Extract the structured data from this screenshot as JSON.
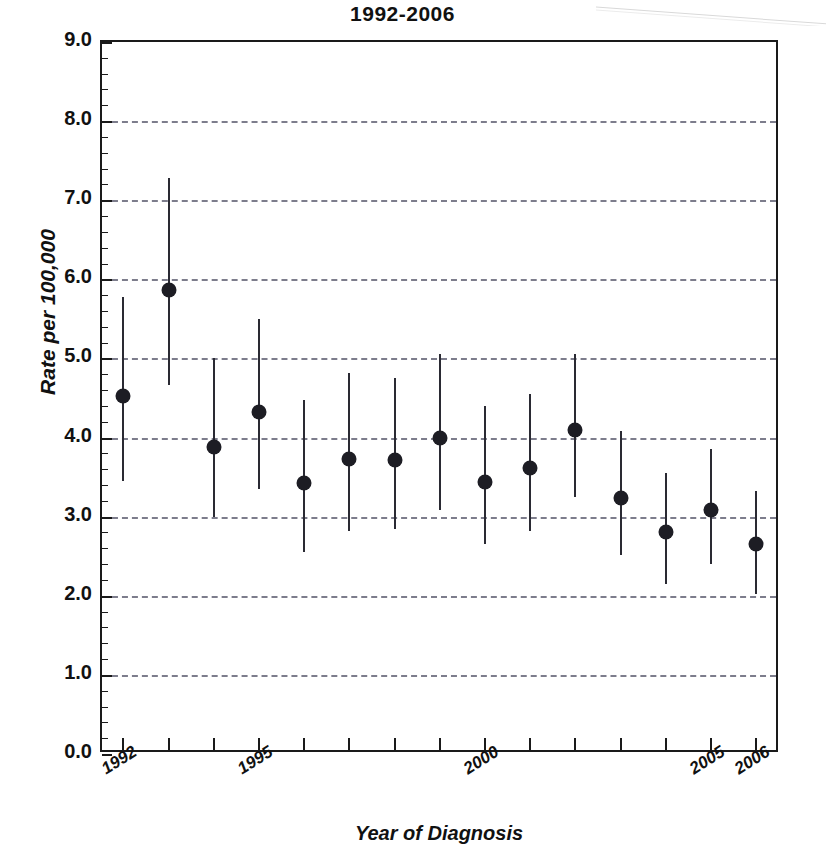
{
  "chart_data": {
    "type": "scatter",
    "title": "1992-2006",
    "xlabel": "Year of Diagnosis",
    "ylabel": "Rate per 100,000",
    "ylim": [
      0.0,
      9.0
    ],
    "ytick_step": 1.0,
    "yticks": [
      "0.0",
      "1.0",
      "2.0",
      "3.0",
      "4.0",
      "5.0",
      "6.0",
      "7.0",
      "8.0",
      "9.0"
    ],
    "grid": "horizontal-dashed",
    "legend": null,
    "marker_style": "filled-circle",
    "errorbar_style": "vertical-line-no-caps",
    "categories": [
      1992,
      1993,
      1994,
      1995,
      1996,
      1997,
      1998,
      1999,
      2000,
      2001,
      2002,
      2003,
      2004,
      2005,
      2006
    ],
    "xtick_labels_shown": [
      "1992",
      "",
      "",
      "1995",
      "",
      "",
      "",
      "",
      "2000",
      "",
      "",
      "",
      "",
      "2005",
      "2006"
    ],
    "series": [
      {
        "name": "Rate per 100,000",
        "values": [
          4.52,
          5.86,
          3.88,
          4.32,
          3.43,
          3.73,
          3.72,
          4.0,
          3.44,
          3.62,
          4.09,
          3.24,
          2.8,
          3.09,
          2.65
        ],
        "ci_low": [
          3.45,
          4.67,
          3.0,
          3.35,
          2.55,
          2.82,
          2.85,
          3.08,
          2.65,
          2.82,
          3.25,
          2.52,
          2.15,
          2.4,
          2.02
        ],
        "ci_high": [
          5.78,
          7.28,
          5.0,
          5.5,
          4.48,
          4.82,
          4.75,
          5.05,
          4.4,
          4.55,
          5.05,
          4.08,
          3.55,
          3.85,
          3.32
        ]
      }
    ],
    "points": [
      {
        "year": "1992",
        "label": "1992",
        "value": 4.52,
        "ci_low": 3.45,
        "ci_high": 5.78
      },
      {
        "year": "1993",
        "label": "",
        "value": 5.86,
        "ci_low": 4.67,
        "ci_high": 7.28
      },
      {
        "year": "1994",
        "label": "",
        "value": 3.88,
        "ci_low": 3.0,
        "ci_high": 5.0
      },
      {
        "year": "1995",
        "label": "1995",
        "value": 4.32,
        "ci_low": 3.35,
        "ci_high": 5.5
      },
      {
        "year": "1996",
        "label": "",
        "value": 3.43,
        "ci_low": 2.55,
        "ci_high": 4.48
      },
      {
        "year": "1997",
        "label": "",
        "value": 3.73,
        "ci_low": 2.82,
        "ci_high": 4.82
      },
      {
        "year": "1998",
        "label": "",
        "value": 3.72,
        "ci_low": 2.85,
        "ci_high": 4.75
      },
      {
        "year": "1999",
        "label": "",
        "value": 4.0,
        "ci_low": 3.08,
        "ci_high": 5.05
      },
      {
        "year": "2000",
        "label": "2000",
        "value": 3.44,
        "ci_low": 2.65,
        "ci_high": 4.4
      },
      {
        "year": "2001",
        "label": "",
        "value": 3.62,
        "ci_low": 2.82,
        "ci_high": 4.55
      },
      {
        "year": "2002",
        "label": "",
        "value": 4.09,
        "ci_low": 3.25,
        "ci_high": 5.05
      },
      {
        "year": "2003",
        "label": "",
        "value": 3.24,
        "ci_low": 2.52,
        "ci_high": 4.08
      },
      {
        "year": "2004",
        "label": "",
        "value": 2.8,
        "ci_low": 2.15,
        "ci_high": 3.55
      },
      {
        "year": "2005",
        "label": "2005",
        "value": 3.09,
        "ci_low": 2.4,
        "ci_high": 3.85
      },
      {
        "year": "2006",
        "label": "2006",
        "value": 2.65,
        "ci_low": 2.02,
        "ci_high": 3.32
      }
    ],
    "colors": {
      "marker": "#1d1d24",
      "errorbar": "#2a2a33",
      "grid": "#7d7d8c",
      "axis": "#1a1a1a",
      "background": "#ffffff"
    }
  }
}
